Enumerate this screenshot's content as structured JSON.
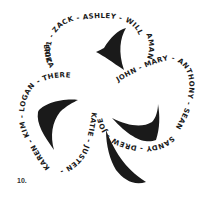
{
  "figure": {
    "number_label": "10.",
    "ink_color": "#1a1a1a",
    "background": "#ffffff"
  },
  "shamrock": {
    "top_leaf_text": "2001 - ZACK - ASHLEY - WILL -",
    "top_right_text": "AMANDA",
    "right_leaf_text": "JOHN - MARY - ANTHONY - SEAN -",
    "right_bottom_text": "SANDY - DREW - JOE",
    "stem_text": "KATIE - JUSTEN -",
    "left_bottom_text": "KAREN - KIM - LOGAN -",
    "left_leaf_text": "- THERESE -",
    "left_top_text": "ERIKA"
  },
  "names": [
    "2001",
    "ZACK",
    "ASHLEY",
    "WILL",
    "AMANDA",
    "JOHN",
    "MARY",
    "ANTHONY",
    "SEAN",
    "SANDY",
    "DREW",
    "JOE",
    "KATIE",
    "JUSTEN",
    "KAREN",
    "KIM",
    "LOGAN",
    "THERESE",
    "ERIKA"
  ]
}
